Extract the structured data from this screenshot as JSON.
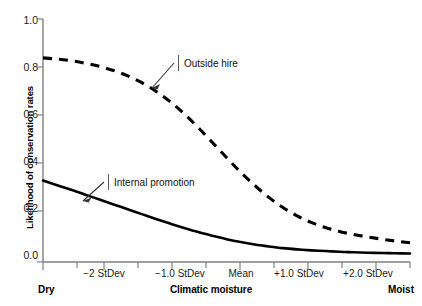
{
  "chart_data": {
    "type": "line",
    "title": "",
    "xlabel": "Climatic moisture",
    "ylabel": "Likelihood of conservation rates",
    "xlim": [
      -2.6,
      2.6
    ],
    "ylim": [
      0.0,
      1.0
    ],
    "grid": false,
    "legend": "inline-annotations",
    "x_axis": {
      "tick_labels": [
        "−2 StDev",
        "−1.0 StDev",
        "Mean",
        "+1.0 StDev",
        "+2.0 StDev"
      ],
      "tick_values": [
        -2.0,
        -1.0,
        0.0,
        1.0,
        2.0
      ],
      "minor_tick_values": [
        -2.5,
        -1.5,
        -0.5,
        0.5,
        1.5,
        2.5
      ],
      "left_endcap": "Dry",
      "right_endcap": "Moist"
    },
    "y_axis": {
      "tick_labels": [
        "0.0",
        "0.2",
        "0.4",
        "0.6",
        "0.8",
        "1.0"
      ],
      "tick_values": [
        0.0,
        0.2,
        0.4,
        0.6,
        0.8,
        1.0
      ]
    },
    "x": [
      -2.6,
      -2.4,
      -2.2,
      -2.0,
      -1.8,
      -1.6,
      -1.4,
      -1.2,
      -1.0,
      -0.8,
      -0.6,
      -0.4,
      -0.2,
      0.0,
      0.2,
      0.4,
      0.6,
      0.8,
      1.0,
      1.2,
      1.4,
      1.6,
      1.8,
      2.0,
      2.2,
      2.4,
      2.6
    ],
    "series": [
      {
        "name": "Outside hire",
        "style": "dashed",
        "color": "#000000",
        "values": [
          0.84,
          0.835,
          0.828,
          0.818,
          0.805,
          0.788,
          0.766,
          0.738,
          0.703,
          0.66,
          0.61,
          0.553,
          0.492,
          0.43,
          0.37,
          0.315,
          0.266,
          0.224,
          0.19,
          0.163,
          0.142,
          0.126,
          0.113,
          0.103,
          0.094,
          0.086,
          0.079
        ]
      },
      {
        "name": "Internal promotion",
        "style": "solid",
        "color": "#000000",
        "values": [
          0.335,
          0.316,
          0.297,
          0.277,
          0.257,
          0.237,
          0.217,
          0.197,
          0.177,
          0.158,
          0.14,
          0.123,
          0.108,
          0.094,
          0.082,
          0.072,
          0.064,
          0.057,
          0.052,
          0.048,
          0.045,
          0.042,
          0.04,
          0.038,
          0.037,
          0.036,
          0.035
        ]
      }
    ],
    "annotations": [
      {
        "label": "Outside hire",
        "points_to_series": "Outside hire"
      },
      {
        "label": "Internal promotion",
        "points_to_series": "Internal promotion"
      }
    ]
  }
}
